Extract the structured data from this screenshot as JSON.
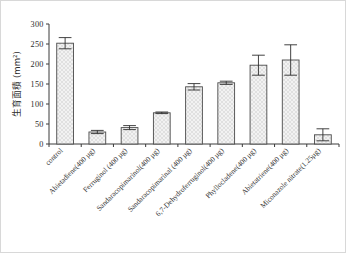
{
  "chart_data": {
    "type": "bar",
    "title": "",
    "xlabel": "",
    "ylabel": "生育面積 (mm²)",
    "ylim": [
      0,
      300
    ],
    "yticks": [
      0,
      50,
      100,
      150,
      200,
      250,
      300
    ],
    "grid": false,
    "legend": null,
    "categories": [
      "control",
      "Abietadiene(400 µg)",
      "Ferruginol (400 µg)",
      "Sandaracopimarinol(400 µg)",
      "Sandaracopimarinal  (400 µg)",
      "6,7-Dehydroferruginol(400 µg)",
      "Phyllocladene(400 µg)",
      "Abietatriene(400 µg)",
      "Miconazole nitrate(1.25µg)"
    ],
    "values": [
      252,
      30,
      41,
      78,
      143,
      153,
      197,
      210,
      23
    ],
    "errors": [
      14,
      4,
      5,
      2,
      8,
      4,
      25,
      38,
      15
    ],
    "bar_face_color": "#f2f2f2",
    "bar_edge_color": "#4a4a4a",
    "axis_color": "#3a3a3a"
  }
}
